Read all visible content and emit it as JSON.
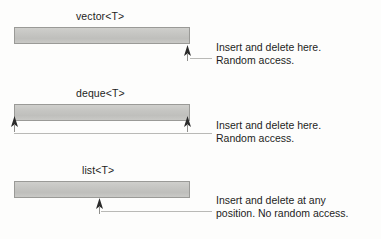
{
  "diagram": {
    "type": "stl-sequence-container-comparison",
    "background_color": "#fdfdfc",
    "bar_fill_color": "#c6c6c3",
    "bar_border_color": "#9a9a97",
    "text_color": "#1d1d1d",
    "leader_line_color": "#b9b9b6",
    "rows": [
      {
        "id": "vector",
        "label": "vector<T>",
        "arrows": [
          {
            "name": "insert-delete-arrow-end",
            "position": "right-end"
          }
        ],
        "callout_lines": [
          "Insert and delete here.",
          "Random access."
        ]
      },
      {
        "id": "deque",
        "label": "deque<T>",
        "arrows": [
          {
            "name": "insert-delete-arrow-front",
            "position": "left-end"
          },
          {
            "name": "insert-delete-arrow-back",
            "position": "right-end"
          }
        ],
        "callout_lines": [
          "Insert and delete here.",
          "Random access."
        ]
      },
      {
        "id": "list",
        "label": "list<T>",
        "arrows": [
          {
            "name": "insert-delete-arrow-any",
            "position": "middle"
          }
        ],
        "callout_lines": [
          "Insert and delete at any",
          "position. No random access."
        ]
      }
    ]
  }
}
